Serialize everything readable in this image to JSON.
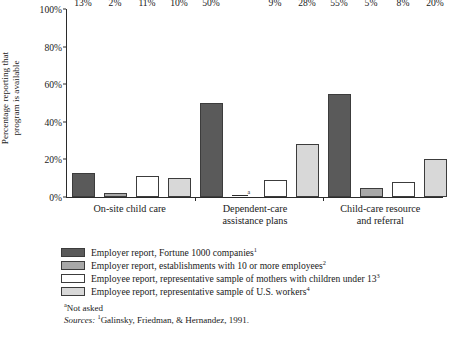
{
  "chart_data": {
    "type": "bar",
    "title": "",
    "xlabel": "",
    "ylabel": "Percentage reporting that program is available",
    "ylim": [
      0,
      100
    ],
    "grid": false,
    "legend_position": "bottom-left",
    "categories": [
      "On-site child care",
      "Dependent-care assistance plans",
      "Child-care resource and referral"
    ],
    "ytick_labels": [
      "100%",
      "80%",
      "60%",
      "40%",
      "20%",
      "0%"
    ],
    "ytick_values": [
      100,
      80,
      60,
      40,
      20,
      0
    ],
    "series": [
      {
        "name": "Employer report, Fortune 1000 companies",
        "superscript": "1",
        "color": "#5a5a5a",
        "values": [
          13,
          50,
          55
        ],
        "labels": [
          "13%",
          "50%",
          "55%"
        ]
      },
      {
        "name": "Employer report, establishments with 10 or more employees",
        "superscript": "2",
        "color": "#a8a8a8",
        "values": [
          2,
          null,
          5
        ],
        "labels": [
          "2%",
          "a",
          "5%"
        ]
      },
      {
        "name": "Employee report, representative sample of mothers with children under 13",
        "superscript": "3",
        "color": "#ffffff",
        "values": [
          11,
          9,
          8
        ],
        "labels": [
          "11%",
          "9%",
          "8%"
        ]
      },
      {
        "name": "Employee report, representative sample of U.S. workers",
        "superscript": "4",
        "color": "#d8d8d8",
        "values": [
          10,
          28,
          20
        ],
        "labels": [
          "10%",
          "28%",
          "20%"
        ]
      }
    ]
  },
  "axis": {
    "ylabel_line1": "Percentage reporting that",
    "ylabel_line2": "program is available"
  },
  "categories_display": [
    {
      "line1": "On-site child care",
      "line2": ""
    },
    {
      "line1": "Dependent-care",
      "line2": "assistance plans"
    },
    {
      "line1": "Child-care resource",
      "line2": "and referral"
    }
  ],
  "legend": {
    "items": [
      {
        "label": "Employer report, Fortune 1000 companies",
        "sup": "1",
        "color": "#5a5a5a"
      },
      {
        "label": "Employer report, establishments with 10 or more employees",
        "sup": "2",
        "color": "#a8a8a8"
      },
      {
        "label": "Employee report, representative sample of mothers with children under 13",
        "sup": "3",
        "color": "#ffffff"
      },
      {
        "label": "Employee report, representative sample of U.S. workers",
        "sup": "4",
        "color": "#d8d8d8"
      }
    ]
  },
  "notes": {
    "footnote_marker": "a",
    "footnote_text": "Not asked",
    "sources_label": "Sources:",
    "source1_sup": "1",
    "source1_text": "Galinsky, Friedman, & Hernandez, 1991."
  },
  "colors": {
    "series1": "#5a5a5a",
    "series2": "#a8a8a8",
    "series3": "#ffffff",
    "series4": "#d8d8d8",
    "axis": "#2b2b2b",
    "text": "#1a1a1a",
    "background": "#ffffff"
  }
}
